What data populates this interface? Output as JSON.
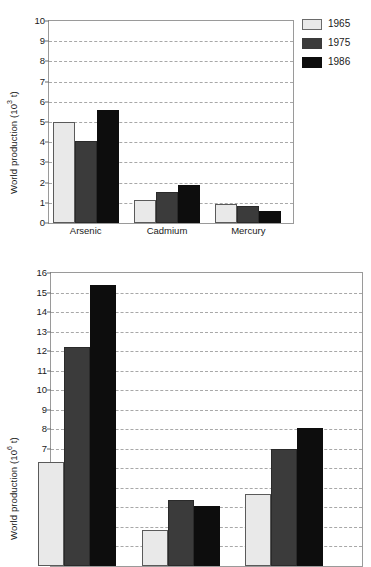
{
  "chart_data": [
    {
      "id": "top",
      "type": "bar",
      "title": "",
      "xlabel": "",
      "ylabel": "World production (10³ t)",
      "ylabel_base": "World production (10",
      "ylabel_exp": "3",
      "ylabel_tail": " t)",
      "ylim": [
        0,
        10
      ],
      "ytick_step": 1,
      "yticks": [
        "0",
        "1",
        "2",
        "3",
        "4",
        "5",
        "6",
        "7",
        "8",
        "9",
        "10"
      ],
      "grid": true,
      "legend_position": "right-top",
      "categories": [
        "Arsenic",
        "Cadmium",
        "Mercury"
      ],
      "series": [
        {
          "name": "1965",
          "color": "#e9e9e9",
          "values": [
            5.0,
            1.15,
            0.92
          ]
        },
        {
          "name": "1975",
          "color": "#3b3b3b",
          "values": [
            4.05,
            1.55,
            0.85
          ]
        },
        {
          "name": "1986",
          "color": "#0d0d0d",
          "values": [
            5.6,
            1.88,
            0.58
          ]
        }
      ]
    },
    {
      "id": "bottom",
      "type": "bar",
      "title": "",
      "xlabel": "",
      "ylabel": "World production (10⁶ t)",
      "ylabel_base": "World production (10",
      "ylabel_exp": "6",
      "ylabel_tail": " t)",
      "ylim": [
        1,
        16
      ],
      "ytick_step": 1,
      "yticks": [
        "2",
        "3",
        "4",
        "5",
        "6",
        "7",
        "8",
        "9",
        "10",
        "11",
        "12",
        "13",
        "14",
        "15",
        "16"
      ],
      "grid": true,
      "legend_position": "none",
      "categories": [
        "",
        "",
        ""
      ],
      "series": [
        {
          "name": "1965",
          "color": "#e9e9e9",
          "values": [
            6.3,
            2.85,
            4.7
          ]
        },
        {
          "name": "1975",
          "color": "#3b3b3b",
          "values": [
            12.2,
            4.4,
            7.0
          ]
        },
        {
          "name": "1986",
          "color": "#0d0d0d",
          "values": [
            15.4,
            4.05,
            8.05
          ]
        }
      ]
    }
  ],
  "legend": {
    "items": [
      {
        "label": "1965",
        "color": "#e9e9e9"
      },
      {
        "label": "1975",
        "color": "#3b3b3b"
      },
      {
        "label": "1986",
        "color": "#0d0d0d"
      }
    ]
  }
}
